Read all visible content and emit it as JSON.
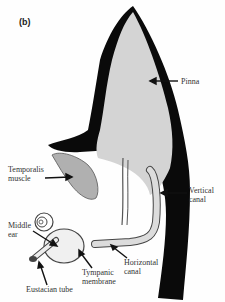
{
  "figure": {
    "panel_label": "(b)",
    "labels": {
      "pinna": "Pinna",
      "temporalis_line1": "Temporalis",
      "temporalis_line2": "muscle",
      "vertical_line1": "Vertical",
      "vertical_line2": "canal",
      "middle_line1": "Middle",
      "middle_line2": "ear",
      "tympanic_line1": "Tympanic",
      "tympanic_line2": "membrane",
      "horizontal_line1": "Horizontal",
      "horizontal_line2": "canal",
      "eustachian": "Eustacian tube"
    },
    "colors": {
      "cartilage_black": "#0a0a0a",
      "tissue_gray": "#d4d4d4",
      "muscle_gray": "#b0b0b0",
      "background": "#fefefe"
    }
  }
}
